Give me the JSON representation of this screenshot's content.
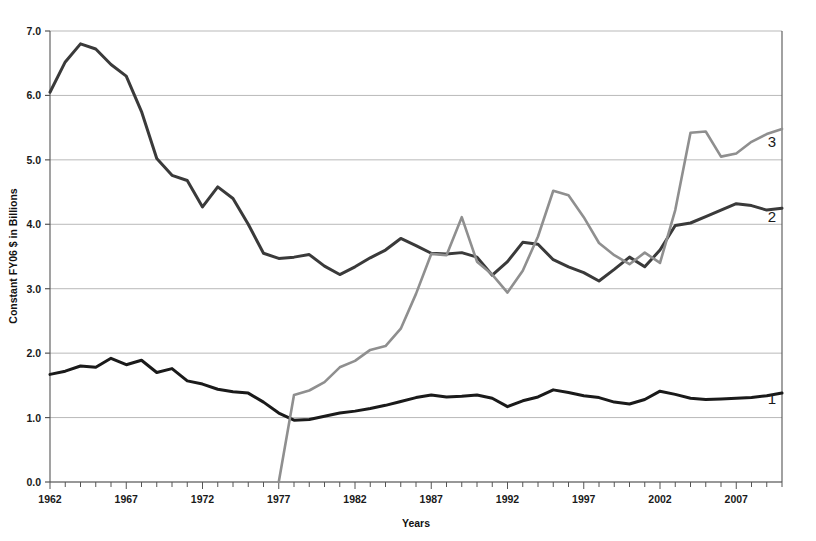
{
  "chart_data": {
    "type": "line",
    "title": "",
    "xlabel": "Years",
    "ylabel": "Constant FY06 $ in Billions",
    "xlim": [
      1962,
      2010
    ],
    "ylim": [
      0.0,
      7.0
    ],
    "y_ticks": [
      "0.0",
      "1.0",
      "2.0",
      "3.0",
      "4.0",
      "5.0",
      "6.0",
      "7.0"
    ],
    "x_ticks": [
      "1962",
      "1967",
      "1972",
      "1977",
      "1982",
      "1987",
      "1992",
      "1997",
      "2002",
      "2007"
    ],
    "x_tick_interval": 5,
    "x_minor_tick_interval": 1,
    "grid": "horizontal",
    "legend_position": "inline-right-of-line-ends",
    "colors": {
      "series1": "#1a1a1a",
      "series2": "#3a3a3a",
      "series3": "#8f8f8f",
      "gridline": "#b9b9b9",
      "axis": "#555555",
      "background": "#ffffff"
    },
    "x": [
      1962,
      1963,
      1964,
      1965,
      1966,
      1967,
      1968,
      1969,
      1970,
      1971,
      1972,
      1973,
      1974,
      1975,
      1976,
      1977,
      1978,
      1979,
      1980,
      1981,
      1982,
      1983,
      1984,
      1985,
      1986,
      1987,
      1988,
      1989,
      1990,
      1991,
      1992,
      1993,
      1994,
      1995,
      1996,
      1997,
      1998,
      1999,
      2000,
      2001,
      2002,
      2003,
      2004,
      2005,
      2006,
      2007,
      2008,
      2009,
      2010
    ],
    "series": [
      {
        "name": "1",
        "label": "1",
        "color": "#1a1a1a",
        "values": [
          1.67,
          1.72,
          1.8,
          1.78,
          1.92,
          1.82,
          1.89,
          1.7,
          1.76,
          1.57,
          1.52,
          1.44,
          1.4,
          1.38,
          1.24,
          1.07,
          0.96,
          0.97,
          1.02,
          1.07,
          1.1,
          1.14,
          1.19,
          1.25,
          1.31,
          1.35,
          1.32,
          1.33,
          1.35,
          1.3,
          1.17,
          1.26,
          1.32,
          1.43,
          1.39,
          1.34,
          1.31,
          1.24,
          1.21,
          1.28,
          1.41,
          1.36,
          1.3,
          1.28,
          1.29,
          1.3,
          1.31,
          1.34,
          1.38
        ]
      },
      {
        "name": "2",
        "label": "2",
        "color": "#3a3a3a",
        "values": [
          6.05,
          6.52,
          6.8,
          6.72,
          6.48,
          6.3,
          5.75,
          5.02,
          4.76,
          4.68,
          4.27,
          4.58,
          4.4,
          4.0,
          3.55,
          3.47,
          3.49,
          3.53,
          3.35,
          3.22,
          3.34,
          3.48,
          3.6,
          3.78,
          3.67,
          3.55,
          3.54,
          3.56,
          3.49,
          3.21,
          3.42,
          3.72,
          3.69,
          3.45,
          3.34,
          3.25,
          3.12,
          3.3,
          3.49,
          3.34,
          3.6,
          3.98,
          4.02,
          4.12,
          4.22,
          4.32,
          4.29,
          4.22,
          4.25
        ]
      },
      {
        "name": "3",
        "label": "3",
        "color": "#8f8f8f",
        "values": [
          null,
          null,
          null,
          null,
          null,
          null,
          null,
          null,
          null,
          null,
          null,
          null,
          null,
          null,
          null,
          0.0,
          1.35,
          1.42,
          1.55,
          1.78,
          1.88,
          2.05,
          2.11,
          2.38,
          2.92,
          3.54,
          3.52,
          4.11,
          3.42,
          3.22,
          2.94,
          3.28,
          3.81,
          4.52,
          4.45,
          4.11,
          3.71,
          3.52,
          3.38,
          3.56,
          3.4,
          4.22,
          5.42,
          5.44,
          5.05,
          5.1,
          5.28,
          5.4,
          5.48
        ]
      }
    ],
    "series_end_labels": [
      {
        "text": "3",
        "x_px": 772,
        "y_px": 147
      },
      {
        "text": "2",
        "x_px": 772,
        "y_px": 222
      },
      {
        "text": "1",
        "x_px": 772,
        "y_px": 404
      }
    ]
  },
  "plot_geometry": {
    "left_px": 50,
    "right_px": 782,
    "top_px": 31,
    "bottom_px": 482
  }
}
